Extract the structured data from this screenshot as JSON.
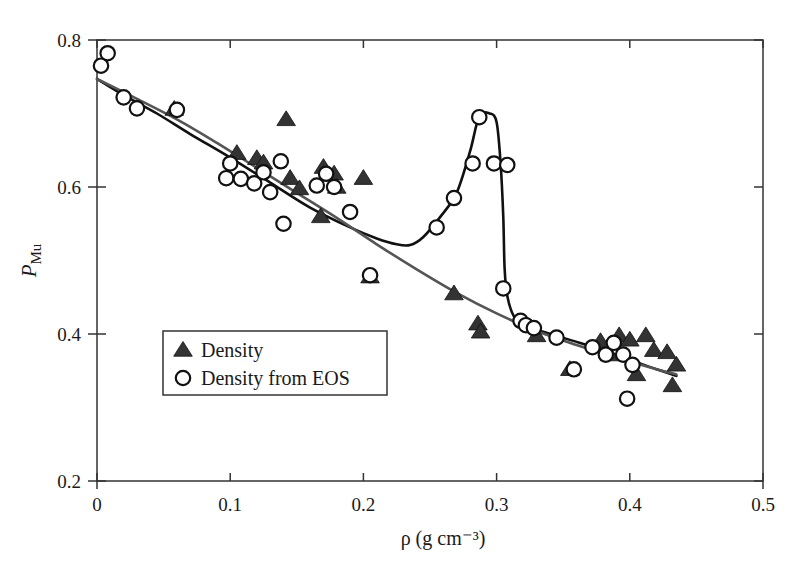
{
  "chart_data": {
    "type": "scatter",
    "title": "",
    "xlabel": "ρ (g cm⁻³)",
    "ylabel": "P_Mu",
    "ylabel_base": "P",
    "ylabel_sub": "Mu",
    "xlim": [
      0,
      0.5
    ],
    "ylim": [
      0.2,
      0.8
    ],
    "xticks": [
      0,
      0.1,
      0.2,
      0.3,
      0.4,
      0.5
    ],
    "xtick_labels": [
      "0",
      "0.1",
      "0.2",
      "0.3",
      "0.4",
      "0.5"
    ],
    "yticks": [
      0.2,
      0.4,
      0.6,
      0.8
    ],
    "ytick_labels": [
      "0.2",
      "0.4",
      "0.6",
      "0.8"
    ],
    "grid": false,
    "legend_position": "lower-left-inside",
    "legend": [
      {
        "label": "Density",
        "marker": "filled-triangle",
        "color": "#333333"
      },
      {
        "label": "Density from EOS",
        "marker": "open-circle",
        "color": "#111111"
      }
    ],
    "series": [
      {
        "name": "Density",
        "marker": "filled-triangle",
        "color": "#333333",
        "points": [
          [
            0.058,
            0.706
          ],
          [
            0.105,
            0.646
          ],
          [
            0.12,
            0.639
          ],
          [
            0.125,
            0.633
          ],
          [
            0.142,
            0.692
          ],
          [
            0.145,
            0.612
          ],
          [
            0.152,
            0.598
          ],
          [
            0.168,
            0.56
          ],
          [
            0.17,
            0.627
          ],
          [
            0.178,
            0.618
          ],
          [
            0.18,
            0.6
          ],
          [
            0.2,
            0.612
          ],
          [
            0.205,
            0.478
          ],
          [
            0.268,
            0.455
          ],
          [
            0.286,
            0.414
          ],
          [
            0.288,
            0.403
          ],
          [
            0.33,
            0.398
          ],
          [
            0.355,
            0.352
          ],
          [
            0.378,
            0.39
          ],
          [
            0.385,
            0.372
          ],
          [
            0.392,
            0.398
          ],
          [
            0.4,
            0.392
          ],
          [
            0.405,
            0.345
          ],
          [
            0.412,
            0.398
          ],
          [
            0.418,
            0.378
          ],
          [
            0.428,
            0.375
          ],
          [
            0.432,
            0.33
          ],
          [
            0.435,
            0.358
          ]
        ]
      },
      {
        "name": "Density from EOS",
        "marker": "open-circle",
        "color": "#111111",
        "points": [
          [
            0.003,
            0.765
          ],
          [
            0.008,
            0.782
          ],
          [
            0.02,
            0.722
          ],
          [
            0.03,
            0.707
          ],
          [
            0.06,
            0.705
          ],
          [
            0.097,
            0.612
          ],
          [
            0.1,
            0.632
          ],
          [
            0.108,
            0.611
          ],
          [
            0.118,
            0.605
          ],
          [
            0.125,
            0.62
          ],
          [
            0.13,
            0.593
          ],
          [
            0.138,
            0.635
          ],
          [
            0.14,
            0.55
          ],
          [
            0.165,
            0.602
          ],
          [
            0.172,
            0.618
          ],
          [
            0.178,
            0.6
          ],
          [
            0.19,
            0.566
          ],
          [
            0.205,
            0.48
          ],
          [
            0.255,
            0.545
          ],
          [
            0.268,
            0.585
          ],
          [
            0.282,
            0.632
          ],
          [
            0.287,
            0.695
          ],
          [
            0.298,
            0.632
          ],
          [
            0.308,
            0.63
          ],
          [
            0.305,
            0.462
          ],
          [
            0.318,
            0.418
          ],
          [
            0.322,
            0.412
          ],
          [
            0.328,
            0.408
          ],
          [
            0.345,
            0.395
          ],
          [
            0.358,
            0.352
          ],
          [
            0.372,
            0.382
          ],
          [
            0.382,
            0.372
          ],
          [
            0.388,
            0.388
          ],
          [
            0.395,
            0.372
          ],
          [
            0.398,
            0.312
          ],
          [
            0.402,
            0.358
          ]
        ]
      }
    ],
    "curves": [
      {
        "name": "black-curve",
        "color": "#111111",
        "width": 2.6,
        "points": [
          [
            0.0,
            0.747
          ],
          [
            0.02,
            0.725
          ],
          [
            0.045,
            0.7
          ],
          [
            0.07,
            0.672
          ],
          [
            0.1,
            0.64
          ],
          [
            0.13,
            0.606
          ],
          [
            0.16,
            0.572
          ],
          [
            0.19,
            0.545
          ],
          [
            0.21,
            0.53
          ],
          [
            0.225,
            0.522
          ],
          [
            0.235,
            0.521
          ],
          [
            0.245,
            0.532
          ],
          [
            0.258,
            0.56
          ],
          [
            0.27,
            0.592
          ],
          [
            0.28,
            0.648
          ],
          [
            0.287,
            0.696
          ],
          [
            0.295,
            0.7
          ],
          [
            0.3,
            0.688
          ],
          [
            0.303,
            0.632
          ],
          [
            0.305,
            0.56
          ],
          [
            0.306,
            0.49
          ],
          [
            0.308,
            0.452
          ],
          [
            0.313,
            0.424
          ],
          [
            0.322,
            0.41
          ],
          [
            0.335,
            0.403
          ],
          [
            0.355,
            0.392
          ],
          [
            0.38,
            0.378
          ],
          [
            0.4,
            0.365
          ],
          [
            0.42,
            0.352
          ],
          [
            0.435,
            0.343
          ]
        ]
      },
      {
        "name": "grey-curve",
        "color": "#555555",
        "width": 2.6,
        "points": [
          [
            0.0,
            0.747
          ],
          [
            0.03,
            0.72
          ],
          [
            0.06,
            0.692
          ],
          [
            0.09,
            0.66
          ],
          [
            0.12,
            0.626
          ],
          [
            0.15,
            0.592
          ],
          [
            0.18,
            0.558
          ],
          [
            0.21,
            0.522
          ],
          [
            0.24,
            0.488
          ],
          [
            0.27,
            0.456
          ],
          [
            0.3,
            0.428
          ],
          [
            0.33,
            0.404
          ],
          [
            0.36,
            0.385
          ],
          [
            0.39,
            0.368
          ],
          [
            0.42,
            0.352
          ],
          [
            0.435,
            0.345
          ]
        ]
      }
    ]
  }
}
